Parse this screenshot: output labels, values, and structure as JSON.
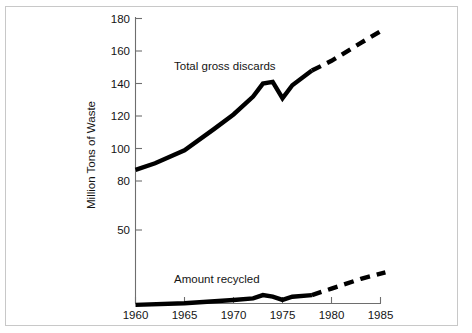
{
  "figure": {
    "background_color": "#ffffff",
    "frame_color": "#c8c8c8",
    "line_color": "#000000",
    "axis_color": "#6e6e6e"
  },
  "axes": {
    "y_title": "Million Tons of Waste",
    "y_ticks": [
      "180",
      "160",
      "140",
      "120",
      "100",
      "80",
      "50"
    ],
    "x_ticks": [
      "1960",
      "1965",
      "1970",
      "1975",
      "1980",
      "1985"
    ]
  },
  "annotations": {
    "total_gross_discards": "Total gross discards",
    "amount_recycled": "Amount recycled"
  },
  "chart_data": {
    "type": "line",
    "title": "",
    "xlabel": "",
    "ylabel": "Million Tons of Waste",
    "xlim": [
      1960,
      1986
    ],
    "ylim": [
      0,
      185
    ],
    "xticks": [
      1960,
      1965,
      1970,
      1975,
      1980,
      1985
    ],
    "yticks": [
      50,
      80,
      100,
      120,
      140,
      160,
      180
    ],
    "grid": false,
    "legend": "none (inline text annotations)",
    "series": [
      {
        "name": "Total gross discards",
        "style": "solid-then-dashed (projection after 1978)",
        "x": [
          1960,
          1962,
          1965,
          1968,
          1970,
          1972,
          1973,
          1974,
          1975,
          1976,
          1978,
          1980,
          1983,
          1985.5
        ],
        "values": [
          87,
          91,
          99,
          112,
          121,
          132,
          140,
          141,
          131,
          139,
          148,
          154,
          165,
          174
        ],
        "solid_until_x": 1978,
        "dashed_from_x": 1978
      },
      {
        "name": "Amount recycled",
        "style": "solid-then-dashed (projection after 1978)",
        "x": [
          1960,
          1965,
          1970,
          1972,
          1973,
          1974,
          1975,
          1976,
          1978,
          1980,
          1983,
          1985.5
        ],
        "values": [
          4,
          5,
          7,
          8,
          10,
          9,
          7,
          9,
          10,
          14,
          20,
          24
        ],
        "solid_until_x": 1978,
        "dashed_from_x": 1978
      }
    ],
    "annotations": [
      {
        "text": "Total gross discards",
        "x": 1965.5,
        "y": 152
      },
      {
        "text": "Amount recycled",
        "x": 1965.5,
        "y": 26
      }
    ]
  }
}
